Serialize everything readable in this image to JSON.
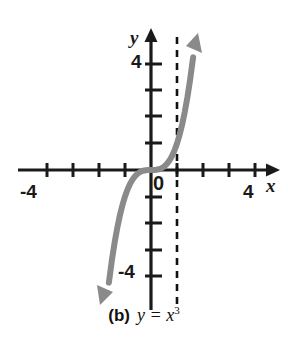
{
  "figure": {
    "background_color": "#ffffff",
    "caption": {
      "letter": "(b)",
      "equation_lhs": "y = x",
      "equation_exponent": "3",
      "full": "(b) y = x3"
    }
  },
  "chart_data": {
    "type": "line",
    "title": "",
    "subtitle": "",
    "function": "y = x^3",
    "xlabel": "x",
    "ylabel": "y",
    "xlim": [
      -4.8,
      4.8
    ],
    "ylim": [
      -5.1,
      5.1
    ],
    "grid": false,
    "legend": null,
    "axis_arrows": {
      "x_positive": true,
      "y_positive": true
    },
    "xticks": [
      -4,
      -3,
      -2,
      -1,
      1,
      2,
      3,
      4
    ],
    "xtick_labels_shown": [
      "-4",
      "4"
    ],
    "yticks": [
      -4,
      -3,
      -2,
      -1,
      1,
      2,
      3,
      4
    ],
    "ytick_labels_shown": [
      "4",
      "-4"
    ],
    "origin_label": "0",
    "series": [
      {
        "name": "y = x^3",
        "color": "#8a8a8a",
        "linewidth": 6,
        "arrow_start": true,
        "arrow_end": true,
        "x": [
          -1.62,
          -1.5,
          -1.4,
          -1.3,
          -1.2,
          -1.1,
          -1.0,
          -0.9,
          -0.8,
          -0.7,
          -0.6,
          -0.5,
          -0.4,
          -0.3,
          -0.2,
          -0.1,
          0,
          0.1,
          0.2,
          0.3,
          0.4,
          0.5,
          0.6,
          0.7,
          0.8,
          0.9,
          1.0,
          1.1,
          1.2,
          1.3,
          1.4,
          1.5,
          1.62
        ],
        "y": [
          -4.25,
          -3.375,
          -2.744,
          -2.197,
          -1.728,
          -1.331,
          -1.0,
          -0.729,
          -0.512,
          -0.343,
          -0.216,
          -0.125,
          -0.064,
          -0.027,
          -0.008,
          -0.001,
          0,
          0.001,
          0.008,
          0.027,
          0.064,
          0.125,
          0.216,
          0.343,
          0.512,
          0.729,
          1.0,
          1.331,
          1.728,
          2.197,
          2.744,
          3.375,
          4.25
        ]
      }
    ],
    "annotations": [
      {
        "type": "vertical-dashed-line",
        "x": 1,
        "y_from": -5.0,
        "y_to": 5.0,
        "color": "#111111",
        "dash": "7,6"
      }
    ]
  }
}
